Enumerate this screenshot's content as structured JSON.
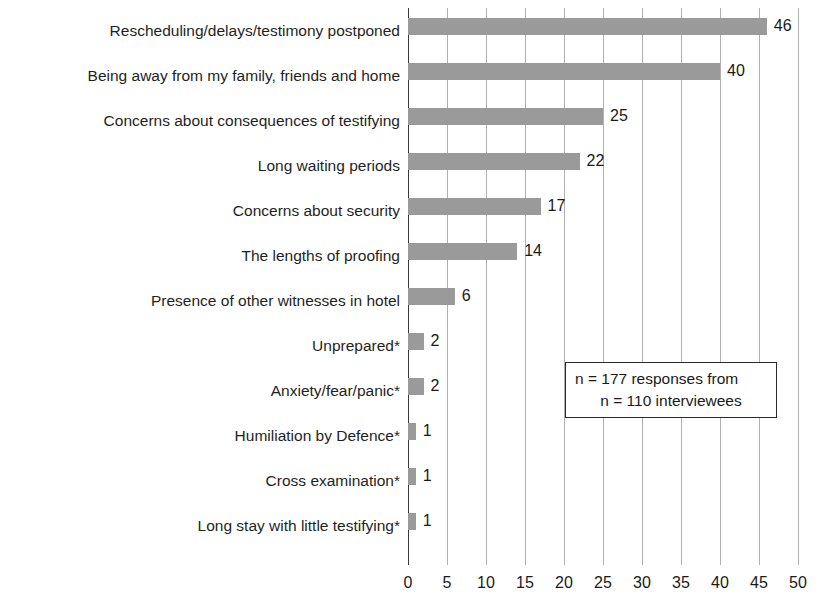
{
  "chart_data": {
    "type": "bar",
    "orientation": "horizontal",
    "title": "",
    "xlabel": "",
    "ylabel": "",
    "xlim": [
      0,
      50
    ],
    "xticks": [
      0,
      5,
      10,
      15,
      20,
      25,
      30,
      35,
      40,
      45,
      50
    ],
    "grid": true,
    "legend_position": "none",
    "bar_color": "#9a9a9a",
    "categories": [
      "Rescheduling/delays/testimony postponed",
      "Being away from my family, friends and home",
      "Concerns about consequences of testifying",
      "Long waiting periods",
      "Concerns about security",
      "The lengths of proofing",
      "Presence of other witnesses in hotel",
      "Unprepared*",
      "Anxiety/fear/panic*",
      "Humiliation by Defence*",
      "Cross examination*",
      "Long stay with little testifying*"
    ],
    "values": [
      46,
      40,
      25,
      22,
      17,
      14,
      6,
      2,
      2,
      1,
      1,
      1
    ],
    "value_labels": [
      "46",
      "40",
      "25",
      "22",
      "17",
      "14",
      "6",
      "2",
      "2",
      "1",
      "1",
      "1"
    ],
    "tick_labels": [
      "0",
      "5",
      "10",
      "15",
      "20",
      "25",
      "30",
      "35",
      "40",
      "45",
      "50"
    ],
    "annotations": [
      "n = 177 responses from",
      "n = 110 interviewees"
    ]
  },
  "annotation": {
    "line1": "n = 177 responses from",
    "line2": "n = 110 interviewees"
  }
}
